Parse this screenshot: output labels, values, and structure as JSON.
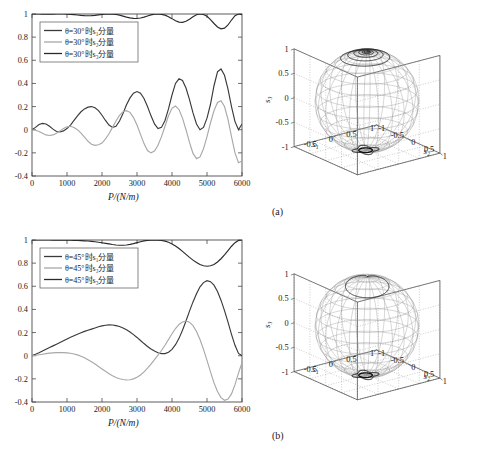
{
  "figure": {
    "caption": "",
    "panels": [
      {
        "id": "a",
        "label": "(a)"
      },
      {
        "id": "b",
        "label": "(b)"
      }
    ]
  },
  "chart_data": [
    {
      "type": "line",
      "panel": "a",
      "title": "",
      "xlabel": "P/(N/m)",
      "ylabel": "",
      "xlim": [
        0,
        6000
      ],
      "ylim": [
        -0.4,
        1.0
      ],
      "xticks": [
        0,
        1000,
        2000,
        3000,
        4000,
        5000,
        6000
      ],
      "xticklabels": [
        "0",
        "1000",
        "2000",
        "3000",
        "4000",
        "5000",
        "6000"
      ],
      "yticks": [
        -0.4,
        -0.2,
        0,
        0.2,
        0.4,
        0.6,
        0.8,
        1
      ],
      "yticklabels": [
        "-0.4",
        "-0.2",
        "0",
        "0.2",
        "0.4",
        "0.6",
        "0.8",
        "1"
      ],
      "grid": false,
      "legend_position": "upper-left",
      "legend": [
        {
          "label": "θ=30°时s₁分量",
          "color": "#3a3a3a"
        },
        {
          "label": "θ=30°时s₂分量",
          "color": "#a8a8a8"
        },
        {
          "label": "θ=30°时s₃分量",
          "color": "#2a2a2a"
        }
      ],
      "x": [
        0,
        100,
        200,
        300,
        400,
        500,
        600,
        700,
        800,
        900,
        1000,
        1100,
        1200,
        1300,
        1400,
        1500,
        1600,
        1700,
        1800,
        1900,
        2000,
        2100,
        2200,
        2300,
        2400,
        2500,
        2600,
        2700,
        2800,
        2900,
        3000,
        3100,
        3200,
        3300,
        3400,
        3500,
        3600,
        3700,
        3800,
        3900,
        4000,
        4100,
        4200,
        4300,
        4400,
        4500,
        4600,
        4700,
        4800,
        4900,
        5000,
        5100,
        5200,
        5300,
        5400,
        5500,
        5600,
        5700,
        5800,
        5900,
        6000
      ],
      "series": [
        {
          "name": "s1",
          "color": "#3a3a3a",
          "values": [
            0,
            0.02,
            0.045,
            0.055,
            0.05,
            0.03,
            0.005,
            -0.015,
            -0.02,
            -0.01,
            0.01,
            0.04,
            0.08,
            0.12,
            0.155,
            0.18,
            0.195,
            0.2,
            0.19,
            0.165,
            0.125,
            0.08,
            0.04,
            0.02,
            0.03,
            0.075,
            0.14,
            0.215,
            0.275,
            0.315,
            0.33,
            0.315,
            0.27,
            0.2,
            0.12,
            0.05,
            0.01,
            0.02,
            0.08,
            0.18,
            0.3,
            0.4,
            0.44,
            0.425,
            0.36,
            0.26,
            0.145,
            0.05,
            0.0,
            0.02,
            0.1,
            0.22,
            0.38,
            0.5,
            0.525,
            0.47,
            0.35,
            0.2,
            0.07,
            0.0,
            0.05
          ]
        },
        {
          "name": "s2",
          "color": "#a8a8a8",
          "values": [
            0,
            -0.005,
            -0.015,
            -0.03,
            -0.045,
            -0.05,
            -0.045,
            -0.03,
            -0.01,
            0.01,
            0.025,
            0.03,
            0.02,
            0.0,
            -0.03,
            -0.065,
            -0.1,
            -0.125,
            -0.135,
            -0.13,
            -0.115,
            -0.08,
            -0.035,
            0.02,
            0.075,
            0.125,
            0.155,
            0.165,
            0.15,
            0.105,
            0.04,
            -0.04,
            -0.12,
            -0.18,
            -0.2,
            -0.185,
            -0.135,
            -0.06,
            0.03,
            0.12,
            0.185,
            0.205,
            0.175,
            0.1,
            0.0,
            -0.11,
            -0.205,
            -0.25,
            -0.235,
            -0.165,
            -0.06,
            0.06,
            0.165,
            0.235,
            0.25,
            0.2,
            0.09,
            -0.06,
            -0.2,
            -0.285,
            -0.27
          ]
        },
        {
          "name": "s3",
          "color": "#2a2a2a",
          "values": [
            1,
            1,
            1,
            0.999,
            0.998,
            0.998,
            0.999,
            1,
            1,
            1,
            0.999,
            0.997,
            0.994,
            0.991,
            0.988,
            0.986,
            0.985,
            0.986,
            0.988,
            0.992,
            0.996,
            0.999,
            1,
            0.999,
            0.996,
            0.99,
            0.982,
            0.973,
            0.966,
            0.962,
            0.961,
            0.965,
            0.973,
            0.983,
            0.992,
            0.998,
            1,
            0.997,
            0.99,
            0.977,
            0.96,
            0.942,
            0.93,
            0.928,
            0.937,
            0.955,
            0.976,
            0.993,
            1,
            0.996,
            0.98,
            0.952,
            0.918,
            0.888,
            0.872,
            0.878,
            0.905,
            0.948,
            0.985,
            1,
            0.993
          ]
        }
      ]
    },
    {
      "type": "line",
      "panel": "b",
      "title": "",
      "xlabel": "P/(N/m)",
      "ylabel": "",
      "xlim": [
        0,
        6000
      ],
      "ylim": [
        -0.4,
        1.0
      ],
      "xticks": [
        0,
        1000,
        2000,
        3000,
        4000,
        5000,
        6000
      ],
      "xticklabels": [
        "0",
        "1000",
        "2000",
        "3000",
        "4000",
        "5000",
        "6000"
      ],
      "yticks": [
        -0.4,
        -0.2,
        0,
        0.2,
        0.4,
        0.6,
        0.8,
        1
      ],
      "yticklabels": [
        "-0.4",
        "-0.2",
        "0",
        "0.2",
        "0.4",
        "0.6",
        "0.8",
        "1"
      ],
      "grid": false,
      "legend_position": "upper-left",
      "legend": [
        {
          "label": "θ=45°时s₁分量",
          "color": "#3a3a3a"
        },
        {
          "label": "θ=45°时s₂分量",
          "color": "#a8a8a8"
        },
        {
          "label": "θ=45°时s₃分量",
          "color": "#2a2a2a"
        }
      ],
      "x": [
        0,
        100,
        200,
        300,
        400,
        500,
        600,
        700,
        800,
        900,
        1000,
        1100,
        1200,
        1300,
        1400,
        1500,
        1600,
        1700,
        1800,
        1900,
        2000,
        2100,
        2200,
        2300,
        2400,
        2500,
        2600,
        2700,
        2800,
        2900,
        3000,
        3100,
        3200,
        3300,
        3400,
        3500,
        3600,
        3700,
        3800,
        3900,
        4000,
        4100,
        4200,
        4300,
        4400,
        4500,
        4600,
        4700,
        4800,
        4900,
        5000,
        5100,
        5200,
        5300,
        5400,
        5500,
        5600,
        5700,
        5800,
        5900,
        6000
      ],
      "series": [
        {
          "name": "s1",
          "color": "#3a3a3a",
          "values": [
            0,
            0.012,
            0.025,
            0.04,
            0.055,
            0.07,
            0.085,
            0.1,
            0.115,
            0.13,
            0.145,
            0.16,
            0.173,
            0.186,
            0.198,
            0.21,
            0.22,
            0.23,
            0.24,
            0.25,
            0.258,
            0.263,
            0.266,
            0.265,
            0.26,
            0.252,
            0.24,
            0.224,
            0.205,
            0.182,
            0.158,
            0.132,
            0.105,
            0.08,
            0.058,
            0.04,
            0.026,
            0.018,
            0.018,
            0.03,
            0.055,
            0.095,
            0.15,
            0.22,
            0.3,
            0.385,
            0.465,
            0.535,
            0.595,
            0.632,
            0.648,
            0.64,
            0.61,
            0.555,
            0.48,
            0.39,
            0.29,
            0.185,
            0.09,
            0.02,
            0.0
          ]
        },
        {
          "name": "s2",
          "color": "#a8a8a8",
          "values": [
            0,
            0.003,
            0.008,
            0.013,
            0.018,
            0.022,
            0.025,
            0.027,
            0.028,
            0.027,
            0.025,
            0.021,
            0.015,
            0.007,
            -0.004,
            -0.018,
            -0.034,
            -0.052,
            -0.072,
            -0.093,
            -0.114,
            -0.135,
            -0.155,
            -0.173,
            -0.188,
            -0.199,
            -0.206,
            -0.21,
            -0.208,
            -0.2,
            -0.186,
            -0.166,
            -0.14,
            -0.108,
            -0.072,
            -0.034,
            0.005,
            0.045,
            0.09,
            0.14,
            0.19,
            0.235,
            0.27,
            0.292,
            0.3,
            0.29,
            0.26,
            0.21,
            0.14,
            0.055,
            -0.04,
            -0.14,
            -0.235,
            -0.31,
            -0.362,
            -0.385,
            -0.375,
            -0.33,
            -0.25,
            -0.15,
            -0.06
          ]
        },
        {
          "name": "s3",
          "color": "#2a2a2a",
          "values": [
            1,
            1,
            1,
            1,
            1,
            1,
            0.999,
            0.999,
            0.999,
            0.999,
            0.998,
            0.998,
            0.997,
            0.996,
            0.995,
            0.993,
            0.991,
            0.988,
            0.985,
            0.981,
            0.976,
            0.971,
            0.966,
            0.961,
            0.957,
            0.955,
            0.955,
            0.957,
            0.962,
            0.969,
            0.977,
            0.985,
            0.992,
            0.997,
            0.999,
            1,
            0.999,
            0.996,
            0.99,
            0.98,
            0.966,
            0.948,
            0.926,
            0.902,
            0.876,
            0.85,
            0.826,
            0.805,
            0.788,
            0.777,
            0.773,
            0.777,
            0.789,
            0.81,
            0.838,
            0.872,
            0.909,
            0.946,
            0.977,
            0.996,
            1
          ]
        }
      ]
    },
    {
      "type": "scatter",
      "panel": "a-sphere",
      "title": "",
      "description": "Poincare sphere with polarization trajectory",
      "xlabel": "s₁",
      "ylabel": "s₂",
      "zlabel": "s₃",
      "xlim": [
        -1,
        1
      ],
      "ylim": [
        -1,
        1
      ],
      "zlim": [
        -1,
        1
      ],
      "xticks": [
        -0.5,
        0,
        0.5,
        1
      ],
      "xticklabels": [
        "-0.5",
        "0",
        "0.5",
        "1"
      ],
      "yticks": [
        -1,
        -0.5,
        0,
        0.5,
        1
      ],
      "yticklabels": [
        "-1",
        "-0.5",
        "0",
        "0.5",
        "1"
      ],
      "zticks": [
        -1,
        -0.5,
        0,
        0.5,
        1
      ],
      "zticklabels": [
        "-1",
        "-0.5",
        "0",
        "0.5",
        "1"
      ],
      "grid": true,
      "trajectory": "small spiral near north pole, tight windings"
    },
    {
      "type": "scatter",
      "panel": "b-sphere",
      "title": "",
      "description": "Poincare sphere with polarization trajectory",
      "xlabel": "s₁",
      "ylabel": "s₂",
      "zlabel": "s₃",
      "xlim": [
        -1,
        1
      ],
      "ylim": [
        -1,
        1
      ],
      "zlim": [
        -1,
        1
      ],
      "xticks": [
        -0.5,
        0,
        0.5,
        1
      ],
      "xticklabels": [
        "-0.5",
        "0",
        "0.5",
        "1"
      ],
      "yticks": [
        -1,
        -0.5,
        0,
        0.5,
        1
      ],
      "yticklabels": [
        "-1",
        "-0.5",
        "0",
        "0.5",
        "1"
      ],
      "zticks": [
        -1,
        -0.5,
        0,
        0.5,
        1
      ],
      "zticklabels": [
        "-1",
        "-0.5",
        "0",
        "0.5",
        "1"
      ],
      "grid": true,
      "trajectory": "large single loop near north pole"
    }
  ],
  "colors": {
    "s1": "#3a3a3a",
    "s2": "#a8a8a8",
    "s3": "#2a2a2a",
    "axis": "#4a4a4a",
    "sphere_mesh": "#8a8a8a",
    "background": "#ffffff"
  }
}
